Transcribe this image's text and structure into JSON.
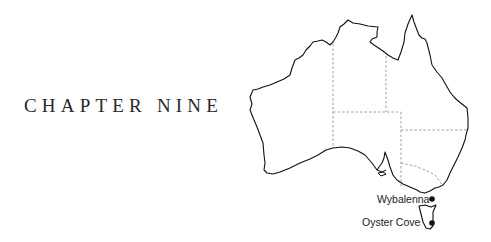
{
  "heading": {
    "text": "CHAPTER NINE"
  },
  "map": {
    "region": "Australia",
    "outline_color": "#111111",
    "border_color": "#888888",
    "places": [
      {
        "name": "Wybalenna",
        "marker": "filled-circle"
      },
      {
        "name": "Oyster Cove",
        "marker": "filled-circle"
      }
    ]
  }
}
